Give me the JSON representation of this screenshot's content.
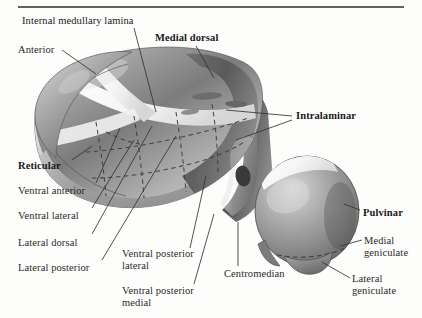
{
  "figure": {
    "title_rule": "top-horizontal-rule",
    "background_color": "#fdfdfc",
    "ink_color": "#2a2a2a"
  },
  "labels": [
    {
      "id": "internal-medullary-lamina",
      "text": "Internal medullary lamina",
      "bold": false,
      "x": 22,
      "y": 15
    },
    {
      "id": "anterior",
      "text": "Anterior",
      "bold": false,
      "x": 18,
      "y": 44
    },
    {
      "id": "medial-dorsal",
      "text": "Medial dorsal",
      "bold": true,
      "x": 155,
      "y": 32
    },
    {
      "id": "intralaminar",
      "text": "Intralaminar",
      "bold": true,
      "x": 296,
      "y": 110
    },
    {
      "id": "reticular",
      "text": "Reticular",
      "bold": true,
      "x": 18,
      "y": 160
    },
    {
      "id": "ventral-anterior",
      "text": "Ventral anterior",
      "bold": false,
      "x": 18,
      "y": 185
    },
    {
      "id": "ventral-lateral",
      "text": "Ventral lateral",
      "bold": false,
      "x": 18,
      "y": 210
    },
    {
      "id": "lateral-dorsal",
      "text": "Lateral dorsal",
      "bold": false,
      "x": 18,
      "y": 237
    },
    {
      "id": "lateral-posterior",
      "text": "Lateral posterior",
      "bold": false,
      "x": 18,
      "y": 262
    },
    {
      "id": "ventral-posterior-lateral",
      "text": "Ventral posterior\nlateral",
      "bold": false,
      "x": 122,
      "y": 248
    },
    {
      "id": "ventral-posterior-medial",
      "text": "Ventral posterior\nmedial",
      "bold": false,
      "x": 122,
      "y": 285
    },
    {
      "id": "centromedian",
      "text": "Centromedian",
      "bold": false,
      "x": 224,
      "y": 268
    },
    {
      "id": "pulvinar",
      "text": "Pulvinar",
      "bold": true,
      "x": 363,
      "y": 207
    },
    {
      "id": "medial-geniculate",
      "text": "Medial\ngeniculate",
      "bold": false,
      "x": 364,
      "y": 235
    },
    {
      "id": "lateral-geniculate",
      "text": "Lateral\ngeniculate",
      "bold": false,
      "x": 352,
      "y": 273
    }
  ]
}
